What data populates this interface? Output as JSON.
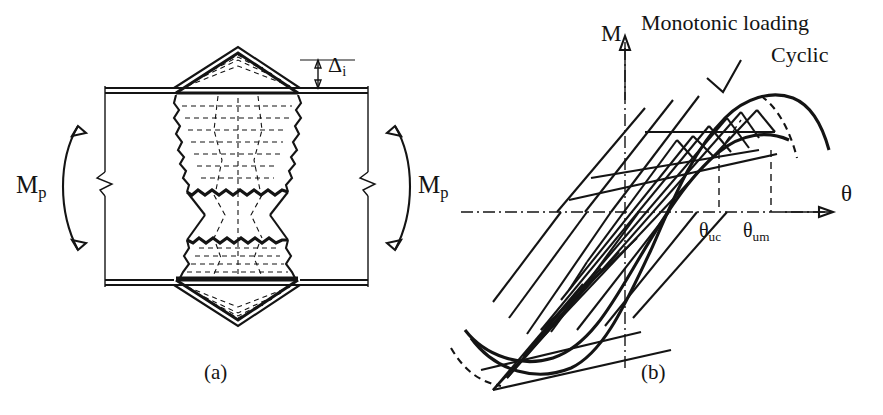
{
  "figure": {
    "panels": [
      {
        "id": "a",
        "caption": "(a)",
        "title": "Plastic hinge with local buckling in beam",
        "labels": {
          "moment_left": "M",
          "moment_left_sub": "p",
          "moment_right": "M",
          "moment_right_sub": "p",
          "deflection": "Δ",
          "deflection_sub": "i"
        }
      },
      {
        "id": "b",
        "caption": "(b)",
        "title": "Moment–rotation hysteresis",
        "labels": {
          "y_axis": "M",
          "x_axis": "θ",
          "monotonic": "Monotonic loading",
          "cyclic": "Cyclic",
          "tick_cyclic": "θ",
          "tick_cyclic_sub": "uc",
          "tick_monotonic": "θ",
          "tick_monotonic_sub": "um"
        }
      }
    ]
  },
  "chart_data": {
    "type": "line",
    "xlabel": "θ",
    "ylabel": "M",
    "grid": false,
    "legend_position": "top-right-inline",
    "axis_style": "centered-cross-with-arrowheads",
    "xlim": [
      -1.15,
      1.15
    ],
    "ylim": [
      -1.15,
      1.15
    ],
    "annotations": [
      {
        "text": "Monotonic loading",
        "points_to": "monotonic envelope peak"
      },
      {
        "text": "Cyclic",
        "points_to": "cyclic envelope peak"
      },
      {
        "text": "θuc",
        "points_to": "rotation at cyclic ultimate moment"
      },
      {
        "text": "θum",
        "points_to": "rotation at monotonic ultimate moment"
      }
    ],
    "dropline_x": [
      0.62,
      0.8
    ],
    "series": [
      {
        "name": "Monotonic loading",
        "style": "solid-thick",
        "comment": "Rising envelope peaking at θum then softening",
        "points": [
          [
            -1.0,
            -0.74
          ],
          [
            -0.86,
            -0.88
          ],
          [
            -0.7,
            -0.95
          ],
          [
            -0.52,
            -0.92
          ],
          [
            -0.36,
            -0.8
          ],
          [
            -0.2,
            -0.62
          ],
          [
            -0.04,
            -0.4
          ],
          [
            0.12,
            -0.14
          ],
          [
            0.28,
            0.16
          ],
          [
            0.42,
            0.44
          ],
          [
            0.56,
            0.66
          ],
          [
            0.68,
            0.8
          ],
          [
            0.8,
            0.86
          ],
          [
            0.92,
            0.82
          ],
          [
            1.02,
            0.72
          ]
        ]
      },
      {
        "name": "Cyclic",
        "style": "solid-thick",
        "comment": "Degraded envelope peaking earlier at θuc and lower",
        "points": [
          [
            -1.0,
            -0.6
          ],
          [
            -0.84,
            -0.72
          ],
          [
            -0.66,
            -0.76
          ],
          [
            -0.48,
            -0.72
          ],
          [
            -0.3,
            -0.6
          ],
          [
            -0.12,
            -0.42
          ],
          [
            0.06,
            -0.2
          ],
          [
            0.24,
            0.08
          ],
          [
            0.4,
            0.34
          ],
          [
            0.52,
            0.52
          ],
          [
            0.62,
            0.62
          ],
          [
            0.72,
            0.64
          ],
          [
            0.84,
            0.6
          ],
          [
            0.96,
            0.54
          ]
        ]
      },
      {
        "name": "Hysteresis loops",
        "style": "solid-thin-parallel",
        "comment": "Nested parallelogram-like cyclic loops with pinching, 7 cycles",
        "loop_count": 7,
        "loop_slope": 1.55,
        "loop_half_widths": [
          0.22,
          0.34,
          0.46,
          0.58,
          0.68,
          0.78,
          0.88
        ]
      }
    ]
  }
}
